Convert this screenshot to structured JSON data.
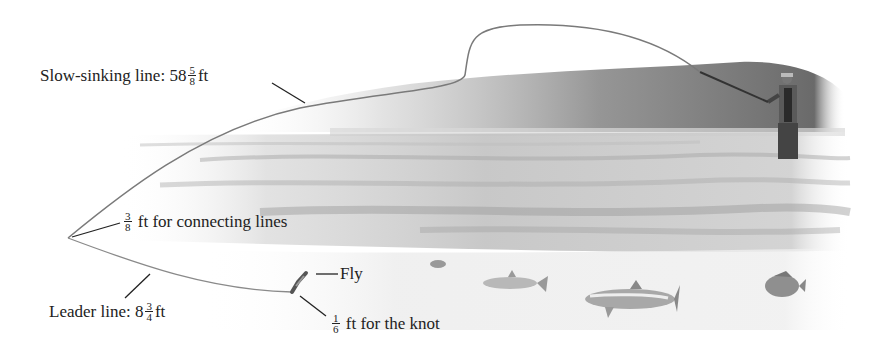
{
  "diagram": {
    "labels": {
      "slow_sinking": {
        "text": "Slow-sinking line: 58",
        "frac_num": "5",
        "frac_den": "8",
        "unit": "ft"
      },
      "connecting": {
        "frac_num": "3",
        "frac_den": "8",
        "text": "ft for connecting lines"
      },
      "leader": {
        "text": "Leader line: 8",
        "frac_num": "3",
        "frac_den": "4",
        "unit": "ft"
      },
      "fly": {
        "text": "Fly"
      },
      "knot": {
        "frac_num": "1",
        "frac_den": "6",
        "text": "ft for the knot"
      }
    },
    "scene_elements": [
      "fisherman",
      "river",
      "tree-line",
      "fish",
      "fly",
      "fishing-line"
    ],
    "colors": {
      "line": "#777777",
      "water_dark": "#9a9a9a",
      "water_light": "#e4e4e4",
      "trees": "#6e6e6e",
      "text": "#222222"
    }
  }
}
